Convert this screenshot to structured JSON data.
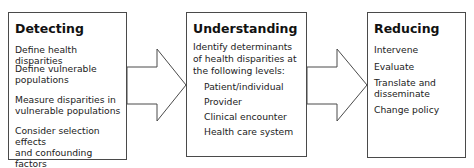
{
  "diagram": {
    "type": "process-flow",
    "stages": [
      {
        "title": "Detecting",
        "items": [
          "Define health disparities",
          "Define vulnerable\npopulations",
          "Measure disparities in\nvulnerable populations",
          "Consider selection effects\nand confounding factors"
        ]
      },
      {
        "title": "Understanding",
        "intro": "Identify determinants\nof health disparities at\nthe following levels:",
        "items": [
          "Patient/individual",
          "Provider",
          "Clinical encounter",
          "Health care system"
        ]
      },
      {
        "title": "Reducing",
        "items": [
          "Intervene",
          "Evaluate",
          "Translate and\ndisseminate",
          "Change policy"
        ]
      }
    ],
    "connectors": [
      {
        "from": "Detecting",
        "to": "Understanding",
        "shape": "block-arrow"
      },
      {
        "from": "Understanding",
        "to": "Reducing",
        "shape": "block-arrow"
      }
    ],
    "colors": {
      "stroke": "#4a4a4a",
      "fill": "#ffffff",
      "text": "#222222"
    }
  }
}
